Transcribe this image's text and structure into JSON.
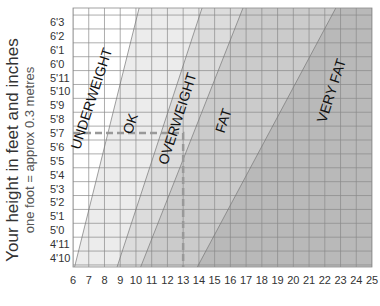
{
  "chart_data": {
    "type": "area",
    "title": "",
    "xlabel": "",
    "ylabel": "Your height in feet and inches",
    "ylabel_sub": "one foot = approx 0.3 metres",
    "x_ticks": [
      "6",
      "7",
      "8",
      "9",
      "10",
      "11",
      "12",
      "13",
      "14",
      "15",
      "16",
      "17",
      "18",
      "19",
      "20",
      "21",
      "22",
      "23",
      "24",
      "25"
    ],
    "xlim": [
      6,
      25
    ],
    "y_ticks": [
      "4'10",
      "4'11",
      "5'0",
      "5'1",
      "5'2",
      "5'3",
      "5'4",
      "5'5",
      "5'6",
      "5'7",
      "5'8",
      "5'9",
      "5'10",
      "5'11",
      "6'0",
      "6'1",
      "6'2",
      "6'3"
    ],
    "ylim_inches": [
      58,
      75
    ],
    "grid": true,
    "zones": [
      {
        "name": "UNDERWEIGHT",
        "color": "#ffffff"
      },
      {
        "name": "OK",
        "color": "#ececec"
      },
      {
        "name": "OVERWEIGHT",
        "color": "#dcdcdc"
      },
      {
        "name": "FAT",
        "color": "#cbcbcb"
      },
      {
        "name": "VERY FAT",
        "color": "#b9b9b9"
      }
    ],
    "boundaries": [
      {
        "between": "UNDERWEIGHT/OK",
        "at_bottom_x": 6.1,
        "at_top_x": 10.2
      },
      {
        "between": "OK/OVERWEIGHT",
        "at_bottom_x": 8.8,
        "at_top_x": 14.2
      },
      {
        "between": "OVERWEIGHT/FAT",
        "at_bottom_x": 10.3,
        "at_top_x": 16.8
      },
      {
        "between": "FAT/VERY FAT",
        "at_bottom_x": 13.9,
        "at_top_x": 22.7
      }
    ],
    "annotation": {
      "type": "dashed-guide",
      "height": "5'7",
      "weight": 13
    }
  }
}
